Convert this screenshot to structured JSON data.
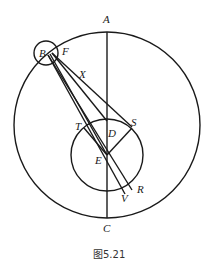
{
  "figure": {
    "caption": "图5.21",
    "labels": {
      "A": "A",
      "B": "B",
      "F": "F",
      "X": "X",
      "T": "T",
      "D": "D",
      "S": "S",
      "E": "E",
      "R": "R",
      "V": "V",
      "C": "C"
    },
    "colors": {
      "stroke": "#1a1a1a",
      "background": "#ffffff"
    }
  }
}
